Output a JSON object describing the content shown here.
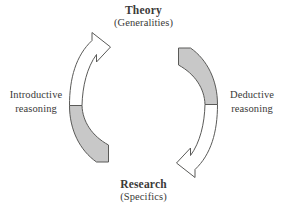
{
  "diagram": {
    "title_top": "Theory",
    "subtitle_top": "(Generalities)",
    "title_bottom": "Research",
    "subtitle_bottom": "(Specifics)",
    "left_label_line1": "Introductive",
    "left_label_line2": "reasoning",
    "right_label_line1": "Deductive",
    "right_label_line2": "reasoning",
    "colors": {
      "background": "#ffffff",
      "text": "#3a3a38",
      "arrow_outline_stroke": "#5a5a58",
      "arrow_outline_fill": "#ffffff",
      "arrow_shaded_fill": "#c8c8c8"
    },
    "arrows": [
      {
        "name": "left-arrow-upward",
        "direction": "upward",
        "from": "Research",
        "to": "Theory",
        "reasoning": "Introductive reasoning"
      },
      {
        "name": "right-arrow-downward",
        "direction": "downward",
        "from": "Theory",
        "to": "Research",
        "reasoning": "Deductive reasoning"
      }
    ]
  }
}
